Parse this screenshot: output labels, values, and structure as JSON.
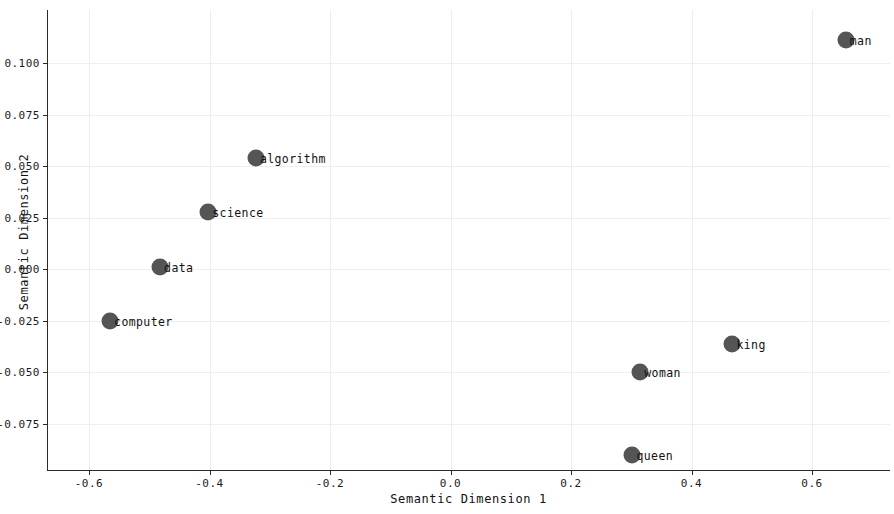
{
  "chart_data": {
    "type": "scatter",
    "title": "",
    "xlabel": "Semantic Dimension 1",
    "ylabel": "Semantic Dimension 2",
    "xlim": [
      -0.64,
      0.76
    ],
    "ylim": [
      -0.098,
      0.125
    ],
    "grid": true,
    "legend": "none",
    "marker_color": "#555555",
    "xticks": [
      -0.6,
      -0.4,
      -0.2,
      0.0,
      0.2,
      0.4,
      0.6
    ],
    "xticklabels": [
      "-0.6",
      "-0.4",
      "-0.2",
      "0.0",
      "0.2",
      "0.4",
      "0.6"
    ],
    "yticks": [
      0.1,
      0.075,
      0.05,
      0.025,
      0.0,
      -0.025,
      -0.05,
      -0.075
    ],
    "yticklabels": [
      "0.100",
      "0.075",
      "0.050",
      "0.025",
      "0.000",
      "-0.025",
      "-0.050",
      "-0.075"
    ],
    "points": [
      {
        "label": "man",
        "x": 0.656,
        "y": 0.111
      },
      {
        "label": "algorithm",
        "x": -0.323,
        "y": 0.054
      },
      {
        "label": "science",
        "x": -0.402,
        "y": 0.028
      },
      {
        "label": "data",
        "x": -0.482,
        "y": 0.001
      },
      {
        "label": "computer",
        "x": -0.565,
        "y": -0.025
      },
      {
        "label": "king",
        "x": 0.468,
        "y": -0.036
      },
      {
        "label": "woman",
        "x": 0.315,
        "y": -0.05
      },
      {
        "label": "queen",
        "x": 0.302,
        "y": -0.09
      }
    ]
  }
}
